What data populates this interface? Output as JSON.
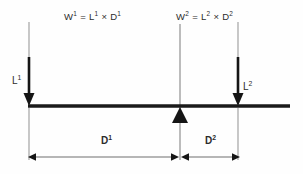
{
  "diagram": {
    "colors": {
      "background": "#fefefe",
      "beam": "#1a1a1a",
      "thin_line": "#8a8a8a",
      "arrow": "#1a1a1a",
      "text": "#2b2b2b"
    },
    "formulas": {
      "left": "W1 = L1 × D1",
      "left_parts": {
        "result": "W",
        "result_sup": "1",
        "equals": "=",
        "factor1": "L",
        "factor1_sup": "1",
        "times": "×",
        "factor2": "D",
        "factor2_sup": "1"
      },
      "right": "W2 = L2 × D2",
      "right_parts": {
        "result": "W",
        "result_sup": "2",
        "equals": "=",
        "factor1": "L",
        "factor1_sup": "2",
        "times": "×",
        "factor2": "D",
        "factor2_sup": "2"
      }
    },
    "loads": {
      "left": {
        "base": "L",
        "sup": "1"
      },
      "right": {
        "base": "L",
        "sup": "2"
      }
    },
    "dimensions": {
      "left": {
        "base": "D",
        "sup": "1"
      },
      "right": {
        "base": "D",
        "sup": "2"
      }
    },
    "geometry": {
      "beam_y": 106,
      "beam_x_start": 28,
      "beam_x_end": 290,
      "fulcrum_x": 180,
      "load_left_x": 29,
      "load_right_x": 238,
      "dimension_line_y": 157
    }
  }
}
